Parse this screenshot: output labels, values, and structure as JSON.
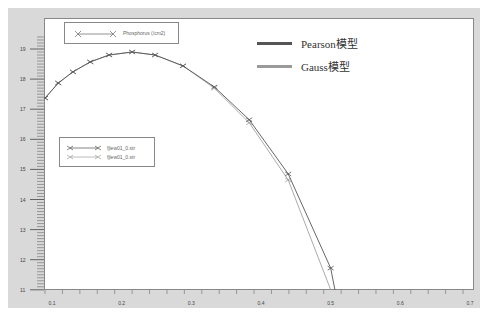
{
  "chart_data": {
    "type": "line",
    "title": "",
    "xlabel": "",
    "ylabel": "",
    "xlim": [
      0.09,
      0.7
    ],
    "ylim": [
      11,
      19.5
    ],
    "x_ticks": [
      "0.1",
      "0.2",
      "0.3",
      "0.4",
      "0.5",
      "0.6",
      "0.7"
    ],
    "y_ticks": [
      "11",
      "12",
      "13",
      "14",
      "15",
      "16",
      "17",
      "18",
      "19"
    ],
    "grid": false,
    "legend_top": "Phosphorus (/cm2)",
    "legend_series": [
      "fjlew01_0.str",
      "fjlew01_0.str"
    ],
    "annotations": [
      "Pearson模型",
      "Gauss模型"
    ],
    "series": [
      {
        "name": "fjlew01_0.str (Pearson)",
        "color": "#555555",
        "x": [
          0.09,
          0.109,
          0.13,
          0.155,
          0.182,
          0.215,
          0.248,
          0.288,
          0.333,
          0.383,
          0.439,
          0.5,
          0.506
        ],
        "y": [
          17.37,
          17.87,
          18.24,
          18.57,
          18.8,
          18.9,
          18.8,
          18.44,
          17.74,
          16.65,
          14.85,
          11.72,
          11.0
        ]
      },
      {
        "name": "fjlew01_0.str (Gauss)",
        "color": "#a0a0a0",
        "x": [
          0.09,
          0.109,
          0.13,
          0.155,
          0.182,
          0.215,
          0.248,
          0.288,
          0.333,
          0.383,
          0.439,
          0.5
        ],
        "y": [
          17.37,
          17.87,
          18.24,
          18.57,
          18.8,
          18.9,
          18.8,
          18.44,
          17.7,
          16.55,
          14.65,
          11.0
        ]
      }
    ]
  },
  "header": {
    "title": ""
  },
  "legend": {
    "top_label": "Phosphorus (/cm2)",
    "series_1": "fjlew01_0.str",
    "series_2": "fjlew01_0.str"
  },
  "models": {
    "pearson": {
      "label": "Pearson模型",
      "color": "#555555"
    },
    "gauss": {
      "label": "Gauss模型",
      "color": "#9a9a9a"
    }
  }
}
